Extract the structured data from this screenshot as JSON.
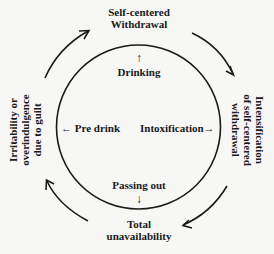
{
  "diagram": {
    "type": "cycle",
    "colors": {
      "stroke": "#1a1a1a",
      "background": "#f7f7f5",
      "text": "#1a1a1a"
    },
    "outer_stages": {
      "top": {
        "lines": [
          "Self-centered",
          "Withdrawal"
        ]
      },
      "right": {
        "lines": [
          "Intensification",
          "of self-centered",
          "withdrawal"
        ]
      },
      "bottom": {
        "lines": [
          "Total",
          "unavailability"
        ]
      },
      "left": {
        "lines": [
          "Irritability or",
          "overindulgence",
          "due to guilt"
        ]
      }
    },
    "inner_stages": {
      "top": {
        "label": "Drinking",
        "arrow": "↑"
      },
      "right": {
        "label": "Intoxification",
        "arrow": "→"
      },
      "bottom": {
        "label": "Passing out",
        "arrow": "↓"
      },
      "left": {
        "label": "Pre drink",
        "arrow": "←"
      }
    },
    "flow_direction": "clockwise"
  }
}
